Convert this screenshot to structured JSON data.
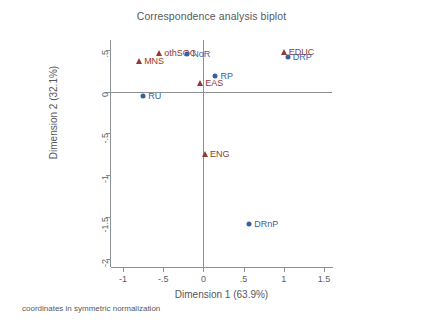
{
  "chart_data": {
    "type": "scatter",
    "title": "Correspondence analysis biplot",
    "xlabel": "Dimension 1 (63.9%)",
    "ylabel": "Dimension 2 (32.1%)",
    "xlim": [
      -1.15,
      1.6
    ],
    "ylim": [
      -2.1,
      0.62
    ],
    "xticks": [
      "-1",
      "-.5",
      "0",
      ".5",
      "1",
      "1.5"
    ],
    "xtickvalues": [
      -1,
      -0.5,
      0,
      0.5,
      1,
      1.5
    ],
    "yticks": [
      ".5",
      "0",
      "-.5",
      "-1",
      "-1.5",
      "-2"
    ],
    "ytickvalues": [
      0.5,
      0,
      -0.5,
      -1,
      -1.5,
      -2
    ],
    "grid": false,
    "legend": "none",
    "footnote": "coordinates in symmetric normalization",
    "zero_reference_lines": true,
    "series": [
      {
        "name": "row-points",
        "marker": "triangle",
        "color": "#8f3a36",
        "points": [
          {
            "label": "othSOC",
            "x": -0.55,
            "y": 0.47,
            "label_pos": "right"
          },
          {
            "label": "MNS",
            "x": -0.8,
            "y": 0.37,
            "label_pos": "right"
          },
          {
            "label": "EDUC",
            "x": 1.0,
            "y": 0.48,
            "label_pos": "right"
          },
          {
            "label": "EAS",
            "x": -0.04,
            "y": 0.1,
            "label_pos": "right"
          },
          {
            "label": "ENG",
            "x": 0.02,
            "y": -0.75,
            "label_pos": "right"
          }
        ]
      },
      {
        "name": "column-points",
        "marker": "circle",
        "color": "#3a5fa0",
        "points": [
          {
            "label": "NoR",
            "x": -0.2,
            "y": 0.45,
            "label_pos": "right"
          },
          {
            "label": "DRP",
            "x": 1.05,
            "y": 0.42,
            "label_pos": "right"
          },
          {
            "label": "RP",
            "x": 0.15,
            "y": 0.19,
            "label_pos": "right"
          },
          {
            "label": "RU",
            "x": -0.75,
            "y": -0.05,
            "label_pos": "right"
          },
          {
            "label": "DRnP",
            "x": 0.57,
            "y": -1.59,
            "label_pos": "right"
          }
        ]
      }
    ]
  },
  "colors": {
    "row_points": "#8f3a36",
    "column_points": "#3a5fa0",
    "axis": "#8d9196",
    "text": "#54585e",
    "background": "#ffffff"
  }
}
